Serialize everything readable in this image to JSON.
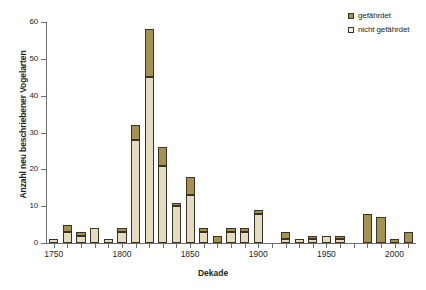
{
  "chart_data": {
    "type": "bar",
    "stacked": true,
    "title": "",
    "xlabel": "Dekade",
    "ylabel": "Anzahl neu beschriebener Vogelarten",
    "xlim": [
      1745,
      2015
    ],
    "ylim": [
      0,
      60
    ],
    "ytick_values": [
      0,
      10,
      20,
      30,
      40,
      50,
      60
    ],
    "ytick_labels": [
      "0",
      "10",
      "20",
      "30",
      "40",
      "50",
      "60"
    ],
    "xtick_values": [
      1750,
      1800,
      1850,
      1900,
      1950,
      2000
    ],
    "xtick_labels": [
      "1750",
      "1800",
      "1850",
      "1900",
      "1950",
      "2000"
    ],
    "grid": false,
    "legend_position": "top-right",
    "categories": [
      1750,
      1760,
      1770,
      1780,
      1790,
      1800,
      1810,
      1820,
      1830,
      1840,
      1850,
      1860,
      1870,
      1880,
      1890,
      1900,
      1910,
      1920,
      1930,
      1940,
      1950,
      1960,
      1970,
      1980,
      1990,
      2000,
      2010
    ],
    "series": [
      {
        "name": "nicht gefährdet",
        "color": "#e4dcc0",
        "values": [
          1,
          3,
          2,
          4,
          1,
          3,
          28,
          45,
          21,
          10,
          13,
          3,
          0,
          3,
          3,
          8,
          0,
          1,
          1,
          1,
          2,
          1,
          0,
          0,
          0,
          0,
          0
        ]
      },
      {
        "name": "gefährdet",
        "color": "#a59253",
        "values": [
          0,
          2,
          1,
          0,
          0,
          1,
          4,
          13,
          5,
          1,
          5,
          1,
          2,
          1,
          1,
          1,
          0,
          2,
          0,
          1,
          0,
          1,
          0,
          8,
          7,
          1,
          3
        ]
      }
    ],
    "totals": [
      1,
      5,
      3,
      4,
      1,
      4,
      32,
      58,
      26,
      11,
      18,
      4,
      2,
      4,
      4,
      9,
      0,
      3,
      1,
      2,
      2,
      2,
      0,
      8,
      7,
      1,
      3
    ]
  },
  "legend": {
    "entries": [
      {
        "label": "gefährdet",
        "swatch": "threat"
      },
      {
        "label": "nicht gefährdet",
        "swatch": "safe"
      }
    ]
  },
  "axes": {
    "y_title": "Anzahl neu beschriebener Vogelarten",
    "x_title": "Dekade"
  },
  "colors": {
    "threatened": "#a59253",
    "not_threatened": "#e4dcc0",
    "outline": "#3a3226",
    "axis": "#6d6e71",
    "text": "#231f20"
  }
}
